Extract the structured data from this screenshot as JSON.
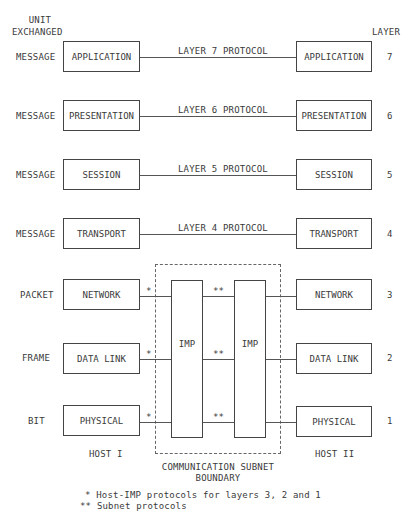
{
  "header": {
    "unit_label_line1": "UNIT",
    "unit_label_line2": "EXCHANGED",
    "layer_label": "LAYER"
  },
  "layers": [
    {
      "number": "7",
      "name": "APPLICATION",
      "unit": "MESSAGE",
      "protocol": "LAYER 7 PROTOCOL"
    },
    {
      "number": "6",
      "name": "PRESENTATION",
      "unit": "MESSAGE",
      "protocol": "LAYER 6 PROTOCOL"
    },
    {
      "number": "5",
      "name": "SESSION",
      "unit": "MESSAGE",
      "protocol": "LAYER 5 PROTOCOL"
    },
    {
      "number": "4",
      "name": "TRANSPORT",
      "unit": "MESSAGE",
      "protocol": "LAYER 4 PROTOCOL"
    },
    {
      "number": "3",
      "name": "NETWORK",
      "unit": "PACKET",
      "host_imp_mark": "*",
      "subnet_mark": "**"
    },
    {
      "number": "2",
      "name": "DATA LINK",
      "unit": "FRAME",
      "host_imp_mark": "*",
      "subnet_mark": "**"
    },
    {
      "number": "1",
      "name": "PHYSICAL",
      "unit": "BIT",
      "host_imp_mark": "*",
      "subnet_mark": "**"
    }
  ],
  "imps": [
    {
      "label": "IMP"
    },
    {
      "label": "IMP"
    }
  ],
  "hosts": {
    "left": "HOST I",
    "right": "HOST II"
  },
  "subnet_boundary": {
    "line1": "COMMUNICATION SUBNET",
    "line2": "BOUNDARY"
  },
  "footnotes": [
    {
      "mark": "*",
      "text": "Host-IMP protocols for layers 3, 2 and 1"
    },
    {
      "mark": "**",
      "text": "Subnet protocols"
    }
  ]
}
